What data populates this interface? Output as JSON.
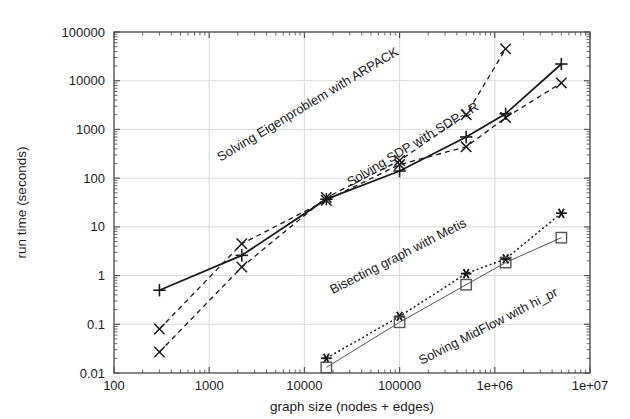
{
  "chart_data": {
    "type": "line",
    "title": "",
    "subtitle": "",
    "xlabel": "graph size (nodes + edges)",
    "ylabel": "run time (seconds)",
    "xscale": "log",
    "yscale": "log",
    "xlim": [
      100,
      10000000
    ],
    "ylim": [
      0.01,
      100000
    ],
    "grid": true,
    "legend_position": "inline-curve-labels",
    "xtick_labels": [
      "100",
      "1000",
      "10000",
      "100000",
      "1e+06",
      "1e+07"
    ],
    "xtick_values": [
      100,
      1000,
      10000,
      100000,
      1000000,
      10000000
    ],
    "ytick_labels": [
      "0.01",
      "0.1",
      "1",
      "10",
      "100",
      "1000",
      "10000",
      "100000"
    ],
    "ytick_values": [
      0.01,
      0.1,
      1,
      10,
      100,
      1000,
      10000,
      100000
    ],
    "series": [
      {
        "name": "Solving Eigenproblem with ARPACK",
        "marker": "x",
        "linestyle": "dashed",
        "color": "#1a1a1a",
        "label_angle": -31,
        "x": [
          300,
          2200,
          17000,
          100000,
          500000,
          1300000
        ],
        "y": [
          0.027,
          1.5,
          40,
          230,
          2000,
          45000
        ]
      },
      {
        "name": "Solving SDP with SDP-LR",
        "marker": "plus",
        "linestyle": "solid",
        "color": "#1a1a1a",
        "label_angle": -31,
        "x": [
          300,
          2200,
          17000,
          100000,
          500000,
          1300000,
          5000000
        ],
        "y": [
          0.5,
          2.6,
          37,
          140,
          700,
          2100,
          22000
        ]
      },
      {
        "name": "Solving SDP with SDP-LR lower",
        "marker": "x",
        "linestyle": "dashed",
        "color": "#1a1a1a",
        "label_angle": -31,
        "x": [
          300,
          2200,
          17000,
          100000,
          500000,
          1300000,
          5000000
        ],
        "y": [
          0.08,
          4.5,
          35,
          190,
          440,
          1750,
          9000
        ]
      },
      {
        "name": "Bisecting graph with Metis",
        "marker": "star",
        "linestyle": "dotted",
        "color": "#1a1a1a",
        "label_angle": -27,
        "x": [
          17000,
          100000,
          500000,
          1300000,
          5000000
        ],
        "y": [
          0.02,
          0.145,
          1.1,
          2.2,
          19
        ]
      },
      {
        "name": "Solving MidFlow with hi_pr",
        "marker": "square",
        "linestyle": "solid-thin",
        "color": "#555555",
        "label_angle": -27,
        "x": [
          17000,
          100000,
          500000,
          1300000,
          5000000
        ],
        "y": [
          0.013,
          0.11,
          0.65,
          1.85,
          6.0
        ]
      }
    ],
    "curve_labels": [
      {
        "text": "Solving Eigenproblem with ARPACK",
        "x": 310,
        "y": 108,
        "angle": -31
      },
      {
        "text": "Solving SDP with SDP-LR",
        "x": 415,
        "y": 148,
        "angle": -31
      },
      {
        "text": "Bisecting graph with Metis",
        "x": 400,
        "y": 260,
        "angle": -27
      },
      {
        "text": "Solving MidFlow with hi_pr",
        "x": 490,
        "y": 330,
        "angle": -27
      }
    ],
    "colors": {
      "axis": "#555555",
      "grid": "#d8d8d8",
      "ink": "#1a1a1a",
      "hipr": "#666666",
      "background": "#ffffff"
    }
  }
}
